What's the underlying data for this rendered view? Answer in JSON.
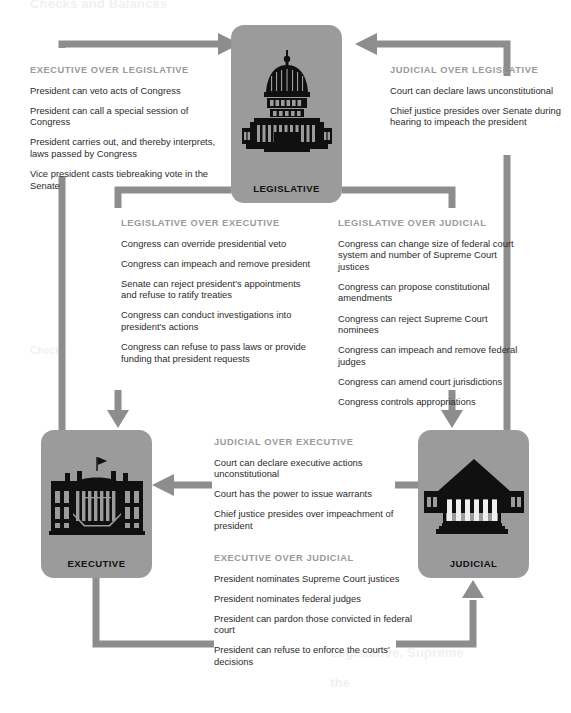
{
  "page": {
    "background": "#ffffff",
    "box_fill": "#9b9b9b",
    "arrow_color": "#8d8d8d",
    "heading_color": "#9a9a9a",
    "body_color": "#2b2b2b"
  },
  "ghost_texts": [
    {
      "text": "Checks and Balances",
      "x": 30,
      "y": 2,
      "size": 13
    },
    {
      "text": "Checks",
      "x": 30,
      "y": 348,
      "size": 10
    },
    {
      "text": "Legislative, Supreme",
      "x": 330,
      "y": 648,
      "size": 13
    },
    {
      "text": "the",
      "x": 330,
      "y": 678,
      "size": 13
    }
  ],
  "branches": [
    {
      "id": "legislative",
      "label": "LEGISLATIVE",
      "icon": "capitol-dome-icon"
    },
    {
      "id": "executive",
      "label": "EXECUTIVE",
      "icon": "white-house-icon"
    },
    {
      "id": "judicial",
      "label": "JUDICIAL",
      "icon": "supreme-court-icon"
    }
  ],
  "blocks": {
    "exec_over_leg": {
      "heading": "EXECUTIVE OVER LEGISLATIVE",
      "items": [
        "President can veto acts of Congress",
        "President can call a special session of Congress",
        "President carries out, and thereby interprets, laws passed by Congress",
        "Vice president casts tiebreaking vote in the Senate"
      ]
    },
    "jud_over_leg": {
      "heading": "JUDICIAL OVER LEGISLATIVE",
      "items": [
        "Court can declare laws unconstitutional",
        "Chief justice presides over Senate during hearing to impeach the president"
      ]
    },
    "leg_over_exec": {
      "heading": "LEGISLATIVE OVER EXECUTIVE",
      "items": [
        "Congress can override presidential veto",
        "Congress can impeach and remove president",
        "Senate can reject president's appointments and refuse to ratify treaties",
        "Congress can conduct investigations into president's actions",
        "Congress can refuse to pass laws or provide funding that president requests"
      ]
    },
    "leg_over_jud": {
      "heading": "LEGISLATIVE OVER JUDICIAL",
      "items": [
        "Congress can change size of federal court system and number of Supreme Court justices",
        "Congress can propose constitutional amendments",
        "Congress can reject Supreme Court nominees",
        "Congress can impeach and remove federal judges",
        "Congress can amend court jurisdictions",
        "Congress controls appropriations"
      ]
    },
    "jud_over_exec": {
      "heading": "JUDICIAL OVER EXECUTIVE",
      "items": [
        "Court can declare executive actions unconstitutional",
        "Court has the power to issue warrants",
        "Chief justice presides over impeachment of president"
      ]
    },
    "exec_over_jud": {
      "heading": "EXECUTIVE OVER JUDICIAL",
      "items": [
        "President nominates Supreme Court justices",
        "President nominates federal judges",
        "President can pardon those convicted in federal court",
        "President can refuse to enforce the courts' decisions"
      ]
    }
  },
  "arrows": [
    {
      "name": "executive-to-legislative-arrow",
      "from": "executive",
      "to": "legislative"
    },
    {
      "name": "judicial-to-legislative-arrow",
      "from": "judicial",
      "to": "legislative"
    },
    {
      "name": "legislative-to-executive-arrow",
      "from": "legislative",
      "to": "executive"
    },
    {
      "name": "legislative-to-judicial-arrow",
      "from": "legislative",
      "to": "judicial"
    },
    {
      "name": "judicial-to-executive-arrow",
      "from": "judicial",
      "to": "executive"
    },
    {
      "name": "executive-to-judicial-arrow",
      "from": "executive",
      "to": "judicial"
    }
  ]
}
